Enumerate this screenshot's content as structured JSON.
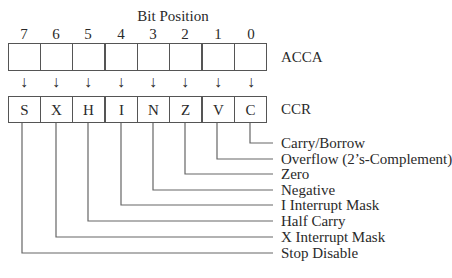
{
  "title": "Bit Position",
  "bit_positions": [
    "7",
    "6",
    "5",
    "4",
    "3",
    "2",
    "1",
    "0"
  ],
  "registers": {
    "acca": {
      "label": "ACCA",
      "cells": [
        "",
        "",
        "",
        "",
        "",
        "",
        "",
        ""
      ]
    },
    "ccr": {
      "label": "CCR",
      "cells": [
        "S",
        "X",
        "H",
        "I",
        "N",
        "Z",
        "V",
        "C"
      ]
    }
  },
  "arrow_glyph": "↓",
  "flags": [
    {
      "bit": "0",
      "symbol": "C",
      "name": "Carry/Borrow"
    },
    {
      "bit": "1",
      "symbol": "V",
      "name": "Overflow (2’s-Complement)"
    },
    {
      "bit": "2",
      "symbol": "Z",
      "name": "Zero"
    },
    {
      "bit": "3",
      "symbol": "N",
      "name": "Negative"
    },
    {
      "bit": "4",
      "symbol": "I",
      "name": "I Interrupt Mask"
    },
    {
      "bit": "5",
      "symbol": "H",
      "name": "Half Carry"
    },
    {
      "bit": "6",
      "symbol": "X",
      "name": "X Interrupt Mask"
    },
    {
      "bit": "7",
      "symbol": "S",
      "name": "Stop Disable"
    }
  ],
  "colors": {
    "line": "#555555",
    "text": "#2a2a2a",
    "background": "#ffffff"
  }
}
